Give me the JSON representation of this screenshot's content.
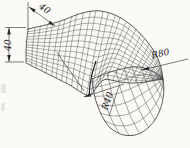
{
  "figure": {
    "annotations": {
      "top_width": "40",
      "side_height": "40",
      "outer_radius": "R80",
      "inner_radius": "R40"
    },
    "colors": {
      "background": "#fbfaf7",
      "mesh_line": "#4d4d4d",
      "outline": "#2e2e2e",
      "dimension": "#2a2a2a",
      "text": "#1c1c1c"
    }
  }
}
